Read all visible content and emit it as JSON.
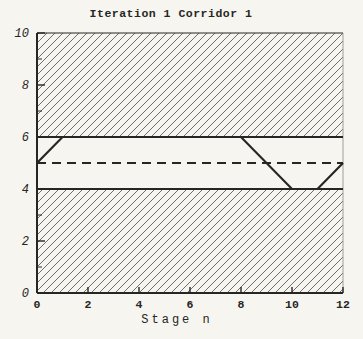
{
  "chart_data": {
    "type": "line",
    "title": "Iteration 1 Corridor 1",
    "xlabel": "Stage n",
    "ylabel": "",
    "xlim": [
      0,
      12
    ],
    "ylim": [
      0,
      10
    ],
    "x_ticks": [
      0,
      2,
      4,
      6,
      8,
      10,
      12
    ],
    "x_tick_labels": [
      "0",
      "2",
      "4",
      "6",
      "8",
      "10",
      "12"
    ],
    "y_ticks": [
      0,
      2,
      4,
      6,
      8,
      10
    ],
    "y_tick_labels": [
      "0",
      "2",
      "4",
      "6",
      "8",
      "10"
    ],
    "y_minor_ticks": [
      1,
      3,
      5,
      7,
      9
    ],
    "grid": false,
    "legend": false,
    "corridor": {
      "upper_bound": 6,
      "lower_bound": 4,
      "center_dashed_line_y": 5,
      "hatched_bands_y": [
        [
          6,
          10
        ],
        [
          0,
          4
        ]
      ],
      "hatch_style": "diagonal-forward-slash"
    },
    "series": [
      {
        "name": "trajectory",
        "x": [
          0,
          1,
          8,
          10,
          11,
          12
        ],
        "y": [
          5,
          6,
          6,
          4,
          4,
          5
        ]
      }
    ],
    "colors": {
      "paper": "#f6f5f0",
      "ink": "#262624",
      "hatch": "#45433e",
      "faint_border": "#8a887f"
    }
  }
}
